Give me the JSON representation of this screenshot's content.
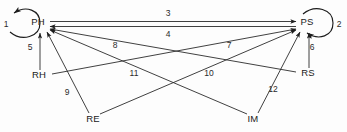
{
  "diagram": {
    "type": "path-diagram",
    "title": "",
    "background_color": "#fdfdfd",
    "line_color": "#2b2b2b",
    "text_color": "#1a1a1a",
    "nodes": [
      {
        "id": "PH",
        "label": "PH",
        "x": 38,
        "y": 22
      },
      {
        "id": "PS",
        "label": "PS",
        "x": 307,
        "y": 22
      },
      {
        "id": "RH",
        "label": "RH",
        "x": 39,
        "y": 75
      },
      {
        "id": "RS",
        "label": "RS",
        "x": 308,
        "y": 73
      },
      {
        "id": "RE",
        "label": "RE",
        "x": 93,
        "y": 119
      },
      {
        "id": "IM",
        "label": "IM",
        "x": 253,
        "y": 119
      }
    ],
    "edges": [
      {
        "id": "e1",
        "label": "1",
        "from": "PH",
        "to": "PH",
        "kind": "self-loop",
        "label_x": 6,
        "label_y": 25
      },
      {
        "id": "e2",
        "label": "2",
        "from": "PS",
        "to": "PS",
        "kind": "self-loop",
        "label_x": 335,
        "label_y": 25
      },
      {
        "id": "e3",
        "label": "3",
        "from": "PH",
        "to": "PS",
        "kind": "straight",
        "label_x": 168,
        "label_y": 17
      },
      {
        "id": "e4",
        "label": "4",
        "from": "PS",
        "to": "PH",
        "kind": "straight",
        "label_x": 168,
        "label_y": 33
      },
      {
        "id": "e5",
        "label": "5",
        "from": "RH",
        "to": "PH",
        "kind": "straight",
        "label_x": 29,
        "label_y": 48
      },
      {
        "id": "e6",
        "label": "6",
        "from": "RS",
        "to": "PS",
        "kind": "straight",
        "label_x": 311,
        "label_y": 48
      },
      {
        "id": "e7",
        "label": "7",
        "from": "RH",
        "to": "PS",
        "kind": "straight",
        "label_x": 228,
        "label_y": 45
      },
      {
        "id": "e8",
        "label": "8",
        "from": "RS",
        "to": "PH",
        "kind": "straight",
        "label_x": 114,
        "label_y": 45
      },
      {
        "id": "e9",
        "label": "9",
        "from": "RE",
        "to": "PH",
        "kind": "straight",
        "label_x": 67,
        "label_y": 93
      },
      {
        "id": "e10",
        "label": "10",
        "from": "RE",
        "to": "PS",
        "kind": "straight",
        "label_x": 207,
        "label_y": 74
      },
      {
        "id": "e11",
        "label": "11",
        "from": "IM",
        "to": "PH",
        "kind": "straight",
        "label_x": 133,
        "label_y": 74
      },
      {
        "id": "e12",
        "label": "12",
        "from": "IM",
        "to": "PS",
        "kind": "straight",
        "label_x": 272,
        "label_y": 90
      }
    ]
  }
}
